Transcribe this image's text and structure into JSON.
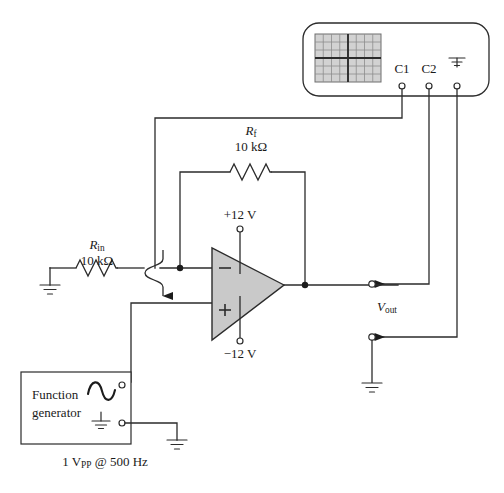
{
  "figure": {
    "background_color": "#ffffff",
    "wire_color": "#2b2b2b",
    "opamp_fill": "#c9c9c9",
    "grid_fill": "#d2d2d2"
  },
  "oscilloscope": {
    "name": "oscilloscope",
    "screen": {
      "name": "oscilloscope-screen",
      "columns": 8,
      "rows": 6
    },
    "terminals": [
      {
        "label": "C1",
        "name": "scope-terminal-c1"
      },
      {
        "label": "C2",
        "name": "scope-terminal-c2"
      },
      {
        "label": "",
        "name": "scope-terminal-ground",
        "icon": "ground-icon"
      }
    ]
  },
  "opamp": {
    "name": "op-amp",
    "inverting_input": "−",
    "noninverting_input": "+",
    "supply_positive": "+12 V",
    "supply_negative": "−12 V"
  },
  "resistors": {
    "feedback": {
      "name": "resistor-rf",
      "symbol": "R",
      "subscript": "f",
      "value": "10 kΩ"
    },
    "input": {
      "name": "resistor-rin",
      "symbol": "R",
      "subscript": "in",
      "value": "10 kΩ"
    }
  },
  "output": {
    "name": "output-node",
    "symbol": "V",
    "subscript": "out"
  },
  "function_generator": {
    "name": "function-generator",
    "line1": "Function",
    "line2": "generator",
    "waveform": "sine-wave-icon",
    "ground": "ground-icon",
    "caption": {
      "amplitude": "1 V",
      "amplitude_sub": "PP",
      "separator": " @ ",
      "frequency": "500 Hz"
    }
  }
}
